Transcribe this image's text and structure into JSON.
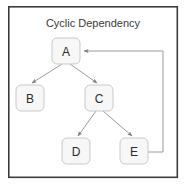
{
  "diagram": {
    "title": "Cyclic Dependency",
    "type": "directed-graph",
    "canvas": {
      "width": 186,
      "height": 186,
      "background": "#ffffff"
    },
    "frame": {
      "x": 8,
      "y": 6,
      "width": 170,
      "height": 172,
      "stroke": "#3c3c3c"
    },
    "colors": {
      "node_fill": "#f7f7f7",
      "node_stroke": "#c9c9c9",
      "edge_stroke": "#9a9a9a",
      "text": "#2b2b2b",
      "title_text": "#3a3a3a",
      "frame_stroke": "#3c3c3c"
    },
    "nodes": [
      {
        "id": "A",
        "label": "A",
        "x": 52,
        "y": 38,
        "width": 28,
        "height": 26,
        "cx": 66,
        "cy": 51
      },
      {
        "id": "B",
        "label": "B",
        "x": 16,
        "y": 85,
        "width": 28,
        "height": 26,
        "cx": 30,
        "cy": 98
      },
      {
        "id": "C",
        "label": "C",
        "x": 85,
        "y": 85,
        "width": 28,
        "height": 26,
        "cx": 99,
        "cy": 98
      },
      {
        "id": "D",
        "label": "D",
        "x": 62,
        "y": 138,
        "width": 28,
        "height": 26,
        "cx": 76,
        "cy": 151
      },
      {
        "id": "E",
        "label": "E",
        "x": 120,
        "y": 138,
        "width": 28,
        "height": 26,
        "cx": 134,
        "cy": 151
      }
    ],
    "edges": [
      {
        "id": "a-b",
        "from": "A",
        "to": "B",
        "kind": "tree",
        "path": "M 62,64 L 32,84",
        "arrow": true
      },
      {
        "id": "a-c",
        "from": "A",
        "to": "C",
        "kind": "tree",
        "path": "M 70,64 L 97,84",
        "arrow": true
      },
      {
        "id": "c-d",
        "from": "C",
        "to": "D",
        "kind": "tree",
        "path": "M 96,111 L 78,136",
        "arrow": true
      },
      {
        "id": "c-e",
        "from": "C",
        "to": "E",
        "kind": "tree",
        "path": "M 103,111 L 132,136",
        "arrow": true
      },
      {
        "id": "e-a",
        "from": "E",
        "to": "A",
        "kind": "cycle",
        "path": "M 148,152 L 163,152 L 163,51 L 83,51",
        "arrow": true
      }
    ]
  }
}
